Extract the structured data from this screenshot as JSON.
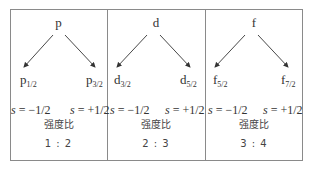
{
  "panels": [
    {
      "orbital": "p",
      "left": {
        "base": "p",
        "sub": "1/2",
        "spin": "s = −1/2"
      },
      "right": {
        "base": "p",
        "sub": "3/2",
        "spin": "s = +1/2"
      },
      "intensity_label": "强度比",
      "ratio": "1 : 2"
    },
    {
      "orbital": "d",
      "left": {
        "base": "d",
        "sub": "3/2",
        "spin": "s = −1/2"
      },
      "right": {
        "base": "d",
        "sub": "5/2",
        "spin": "s = +1/2"
      },
      "intensity_label": "强度比",
      "ratio": "2 : 3"
    },
    {
      "orbital": "f",
      "left": {
        "base": "f",
        "sub": "5/2",
        "spin": "s = −1/2"
      },
      "right": {
        "base": "f",
        "sub": "7/2",
        "spin": "s = +1/2"
      },
      "intensity_label": "强度比",
      "ratio": "3 : 4"
    }
  ],
  "colors": {
    "border": "#8a8a8a",
    "arrow": "#333333",
    "text": "#333333"
  }
}
